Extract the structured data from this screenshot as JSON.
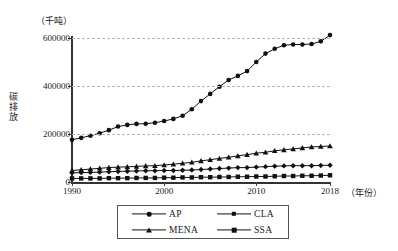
{
  "chart_data": {
    "type": "line",
    "title": "",
    "subtitle": "",
    "unit_label": "（千吨）",
    "ylabel": "碳排放",
    "xlabel": "（年份）",
    "grid": true,
    "legend_position": "bottom",
    "xlim": [
      1990,
      2018
    ],
    "ylim": [
      0,
      600000
    ],
    "yticks": [
      0,
      200000,
      400000,
      600000
    ],
    "ytick_labels": [
      "0",
      "200000",
      "400000",
      "600000"
    ],
    "xticks": [
      1990,
      2000,
      2010,
      2018
    ],
    "xtick_labels": [
      "1990",
      "2000",
      "2010",
      "2018"
    ],
    "x": [
      1990,
      1991,
      1992,
      1993,
      1994,
      1995,
      1996,
      1997,
      1998,
      1999,
      2000,
      2001,
      2002,
      2003,
      2004,
      2005,
      2006,
      2007,
      2008,
      2009,
      2010,
      2011,
      2012,
      2013,
      2014,
      2015,
      2016,
      2017,
      2018
    ],
    "series": [
      {
        "name": "AP",
        "marker": "circle",
        "values": [
          176000,
          184000,
          193000,
          203000,
          216000,
          231000,
          238000,
          242000,
          243000,
          247000,
          254000,
          263000,
          276000,
          303000,
          337000,
          367000,
          397000,
          425000,
          442000,
          462000,
          500000,
          535000,
          555000,
          570000,
          573000,
          573000,
          575000,
          586000,
          612000
        ]
      },
      {
        "name": "CLA",
        "marker": "diamond",
        "values": [
          38000,
          39000,
          40000,
          41000,
          43000,
          44000,
          45000,
          46000,
          47000,
          47000,
          48000,
          48000,
          49000,
          50000,
          52000,
          54000,
          56000,
          58000,
          60000,
          60000,
          62000,
          64000,
          66000,
          67000,
          68000,
          68000,
          68000,
          69000,
          70000
        ]
      },
      {
        "name": "MENA",
        "marker": "triangle",
        "values": [
          48000,
          51000,
          54000,
          57000,
          60000,
          62000,
          63000,
          65000,
          67000,
          68000,
          71000,
          74000,
          78000,
          82000,
          88000,
          93000,
          98000,
          103000,
          109000,
          114000,
          120000,
          124000,
          130000,
          134000,
          138000,
          142000,
          146000,
          148000,
          150000
        ]
      },
      {
        "name": "SSA",
        "marker": "square",
        "values": [
          15000,
          15000,
          15000,
          15000,
          16000,
          16000,
          16000,
          17000,
          17000,
          17000,
          18000,
          18000,
          19000,
          19000,
          20000,
          20000,
          21000,
          21000,
          22000,
          22000,
          23000,
          23000,
          24000,
          25000,
          25000,
          26000,
          26000,
          27000,
          28000
        ]
      }
    ]
  },
  "legend": {
    "items": [
      {
        "label": "AP",
        "marker": "circle"
      },
      {
        "label": "CLA",
        "marker": "diamond"
      },
      {
        "label": "MENA",
        "marker": "triangle"
      },
      {
        "label": "SSA",
        "marker": "square"
      }
    ]
  },
  "colors": {
    "series": "#111111",
    "grid": "#b8b8b8",
    "axis": "#333333",
    "background": "#ffffff"
  }
}
